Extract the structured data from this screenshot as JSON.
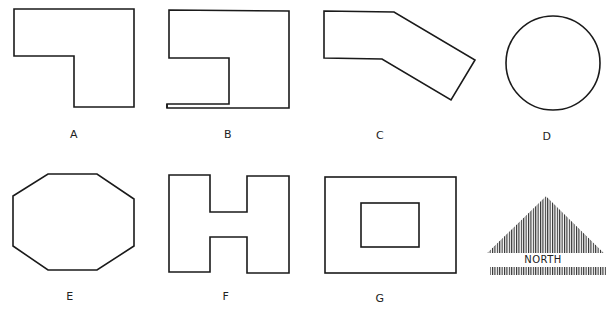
{
  "figure": {
    "shapes": [
      {
        "id": "A",
        "label": "A",
        "kind": "L-shape"
      },
      {
        "id": "B",
        "label": "B",
        "kind": "notched rectangle"
      },
      {
        "id": "C",
        "label": "C",
        "kind": "bent polygon"
      },
      {
        "id": "D",
        "label": "D",
        "kind": "circle"
      },
      {
        "id": "E",
        "label": "E",
        "kind": "octagon"
      },
      {
        "id": "F",
        "label": "F",
        "kind": "H-shape"
      },
      {
        "id": "G",
        "label": "G",
        "kind": "rectangle with courtyard"
      }
    ],
    "north_arrow": {
      "label": "NORTH"
    },
    "stroke_color": "#1a1a1a",
    "background_color": "#ffffff"
  }
}
